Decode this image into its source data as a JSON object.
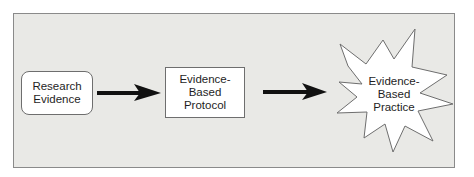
{
  "diagram": {
    "type": "flowchart",
    "nodes": [
      {
        "id": "research",
        "label_lines": [
          "Research",
          "Evidence"
        ],
        "shape": "rounded-rectangle"
      },
      {
        "id": "protocol",
        "label_lines": [
          "Evidence-",
          "Based",
          "Protocol"
        ],
        "shape": "rectangle"
      },
      {
        "id": "practice",
        "label_lines": [
          "Evidence-",
          "Based",
          "Practice"
        ],
        "shape": "starburst"
      }
    ],
    "edges": [
      {
        "from": "research",
        "to": "protocol",
        "style": "thick-arrow"
      },
      {
        "from": "protocol",
        "to": "practice",
        "style": "thick-arrow"
      }
    ],
    "colors": {
      "panel_bg": "#e9e9e6",
      "border": "#6e6e6e",
      "arrow": "#111111",
      "node_fill": "#ffffff"
    }
  }
}
